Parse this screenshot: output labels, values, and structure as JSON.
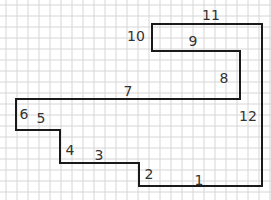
{
  "diagram": {
    "type": "rectilinear-polygon-on-grid",
    "grid": {
      "spacing": 11,
      "color": "#d6d6d6",
      "x_start": 6,
      "y_start": 5
    },
    "shape": {
      "stroke": "#1a1a1a",
      "stroke_width": 2,
      "points": [
        [
          152,
          24
        ],
        [
          262,
          24
        ],
        [
          262,
          186
        ],
        [
          139,
          186
        ],
        [
          139,
          163
        ],
        [
          60,
          163
        ],
        [
          60,
          130
        ],
        [
          16,
          130
        ],
        [
          16,
          99
        ],
        [
          240,
          99
        ],
        [
          240,
          51
        ],
        [
          152,
          51
        ]
      ]
    },
    "edge_labels": [
      {
        "id": "1",
        "text": "1",
        "x": 199,
        "y": 185
      },
      {
        "id": "2",
        "text": "2",
        "x": 149,
        "y": 179
      },
      {
        "id": "3",
        "text": "3",
        "x": 99,
        "y": 160
      },
      {
        "id": "4",
        "text": "4",
        "x": 70,
        "y": 155
      },
      {
        "id": "5",
        "text": "5",
        "x": 41,
        "y": 123
      },
      {
        "id": "6",
        "text": "6",
        "x": 24,
        "y": 119
      },
      {
        "id": "7",
        "text": "7",
        "x": 128,
        "y": 96
      },
      {
        "id": "8",
        "text": "8",
        "x": 224,
        "y": 83
      },
      {
        "id": "9",
        "text": "9",
        "x": 193,
        "y": 46
      },
      {
        "id": "10",
        "text": "10",
        "x": 136,
        "y": 41
      },
      {
        "id": "11",
        "text": "11",
        "x": 211,
        "y": 20
      },
      {
        "id": "12",
        "text": "12",
        "x": 248,
        "y": 121
      }
    ]
  }
}
